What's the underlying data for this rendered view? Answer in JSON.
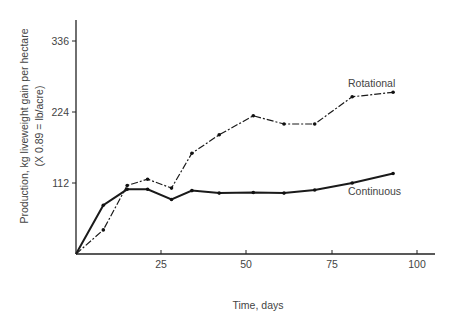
{
  "chart_data": {
    "type": "line",
    "title": "",
    "xlabel": "Time, days",
    "ylabel": "Production,  kg liveweight gain per hectare",
    "ylabel_sub": "(X 0.89 = lb/acre)",
    "xlim": [
      0,
      105
    ],
    "ylim": [
      0,
      370
    ],
    "x_ticks": [
      25,
      50,
      75,
      100
    ],
    "y_ticks": [
      112,
      224,
      336
    ],
    "grid": false,
    "legend": "inline labels",
    "series": [
      {
        "name": "Rotational",
        "style": "dash-dot",
        "x": [
          0,
          8,
          15,
          21,
          28,
          34,
          42,
          52,
          61,
          70,
          81,
          93
        ],
        "values": [
          0,
          38,
          108,
          118,
          104,
          159,
          188,
          218,
          205,
          205,
          248,
          255
        ]
      },
      {
        "name": "Continuous",
        "style": "solid-bold",
        "x": [
          0,
          8,
          15,
          21,
          28,
          34,
          42,
          52,
          61,
          70,
          81,
          93
        ],
        "values": [
          0,
          77,
          102,
          102,
          86,
          100,
          96,
          97,
          96,
          101,
          112,
          127
        ]
      }
    ]
  },
  "labels": {
    "x_axis_title": "Time, days",
    "y_axis_title_line1": "Production,  kg liveweight gain per hectare",
    "y_axis_title_line2": "(X 0.89 = lb/acre)",
    "x_tick_25": "25",
    "x_tick_50": "50",
    "x_tick_75": "75",
    "x_tick_100": "100",
    "y_tick_112": "112",
    "y_tick_224": "224",
    "y_tick_336": "336",
    "series_rotational": "Rotational",
    "series_continuous": "Continuous"
  }
}
